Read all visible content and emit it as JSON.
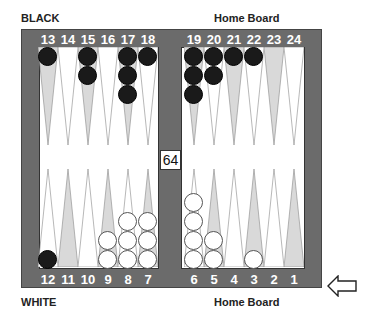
{
  "labels": {
    "top_left": "BLACK",
    "top_right": "Home Board",
    "bottom_left": "WHITE",
    "bottom_right": "Home Board"
  },
  "cube": {
    "value": "64"
  },
  "turn_indicator": {
    "icon": "arrow-left-icon",
    "side": "white"
  },
  "colors": {
    "frame": "#6b6b6b",
    "field": "#ffffff",
    "point_dark": "#d9d9d9",
    "point_light": "#ffffff",
    "checker_black": "#1a1a1a",
    "checker_white": "#ffffff"
  },
  "points": {
    "top": [
      {
        "n": "13",
        "shade": "dark",
        "checkers": 1,
        "color": "black"
      },
      {
        "n": "14",
        "shade": "light",
        "checkers": 0,
        "color": ""
      },
      {
        "n": "15",
        "shade": "dark",
        "checkers": 2,
        "color": "black"
      },
      {
        "n": "16",
        "shade": "light",
        "checkers": 0,
        "color": ""
      },
      {
        "n": "17",
        "shade": "dark",
        "checkers": 3,
        "color": "black"
      },
      {
        "n": "18",
        "shade": "light",
        "checkers": 1,
        "color": "black"
      },
      {
        "n": "19",
        "shade": "dark",
        "checkers": 3,
        "color": "black"
      },
      {
        "n": "20",
        "shade": "light",
        "checkers": 2,
        "color": "black"
      },
      {
        "n": "21",
        "shade": "dark",
        "checkers": 1,
        "color": "black"
      },
      {
        "n": "22",
        "shade": "light",
        "checkers": 1,
        "color": "black"
      },
      {
        "n": "23",
        "shade": "dark",
        "checkers": 0,
        "color": ""
      },
      {
        "n": "24",
        "shade": "light",
        "checkers": 0,
        "color": ""
      }
    ],
    "bottom": [
      {
        "n": "12",
        "shade": "light",
        "checkers": 1,
        "color": "black"
      },
      {
        "n": "11",
        "shade": "dark",
        "checkers": 0,
        "color": ""
      },
      {
        "n": "10",
        "shade": "light",
        "checkers": 0,
        "color": ""
      },
      {
        "n": "9",
        "shade": "dark",
        "checkers": 2,
        "color": "white"
      },
      {
        "n": "8",
        "shade": "light",
        "checkers": 3,
        "color": "white"
      },
      {
        "n": "7",
        "shade": "dark",
        "checkers": 3,
        "color": "white"
      },
      {
        "n": "6",
        "shade": "light",
        "checkers": 4,
        "color": "white"
      },
      {
        "n": "5",
        "shade": "dark",
        "checkers": 2,
        "color": "white"
      },
      {
        "n": "4",
        "shade": "light",
        "checkers": 0,
        "color": ""
      },
      {
        "n": "3",
        "shade": "dark",
        "checkers": 1,
        "color": "white"
      },
      {
        "n": "2",
        "shade": "light",
        "checkers": 0,
        "color": ""
      },
      {
        "n": "1",
        "shade": "dark",
        "checkers": 0,
        "color": ""
      }
    ]
  }
}
